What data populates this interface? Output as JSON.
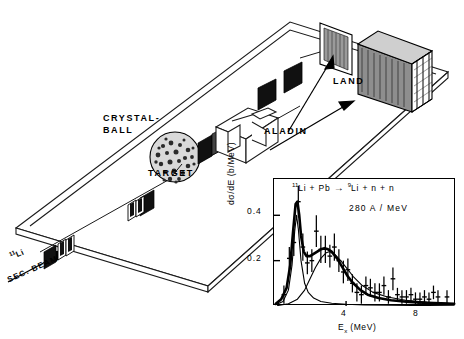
{
  "figure": {
    "type": "experimental-setup-with-inset-spectrum",
    "diagram": {
      "labels": {
        "crystal_ball_line1": "CRYSTAL-",
        "crystal_ball_line2": "BALL",
        "target": "TARGET",
        "aladin": "ALADIN",
        "land": "LAND",
        "beam_ion_sup": "11",
        "beam_ion": "Li",
        "sec_beam": "SEC. BEAM"
      }
    }
  },
  "chart_data": {
    "type": "scatter",
    "title": "",
    "annotations": [
      {
        "name": "reaction",
        "text_parts": [
          "11",
          "Li + Pb ",
          "→",
          " ",
          "9",
          "Li + n + n"
        ]
      },
      {
        "name": "beam-energy",
        "text": "280 A / MeV"
      }
    ],
    "xlabel_parts": [
      "E",
      "x",
      " (MeV)"
    ],
    "ylabel": "dσ/dE  (b/MeV)",
    "xlim": [
      0.0,
      10.1
    ],
    "ylim": [
      0.0,
      0.56
    ],
    "xticks": [
      4,
      8
    ],
    "xticklabels": [
      "4",
      "8"
    ],
    "yticks": [
      0.2,
      0.4
    ],
    "yticklabels": [
      "0.2",
      "0.4"
    ],
    "grid": false,
    "legend": false,
    "x": [
      0.55,
      0.85,
      1.1,
      1.35,
      1.6,
      1.85,
      2.1,
      2.35,
      2.6,
      2.85,
      3.1,
      3.35,
      3.6,
      3.85,
      4.1,
      4.35,
      4.6,
      4.85,
      5.1,
      5.35,
      5.6,
      5.85,
      6.1,
      6.35,
      6.6,
      6.85,
      7.1,
      7.35,
      7.6,
      7.85,
      8.1,
      8.35,
      8.6,
      8.85,
      9.1,
      9.6
    ],
    "y": [
      0.05,
      0.21,
      0.28,
      0.46,
      0.26,
      0.19,
      0.2,
      0.33,
      0.25,
      0.25,
      0.22,
      0.26,
      0.2,
      0.15,
      0.16,
      0.1,
      0.06,
      0.05,
      0.09,
      0.08,
      0.06,
      0.06,
      0.09,
      0.04,
      0.12,
      0.05,
      0.04,
      0.04,
      0.05,
      0.03,
      0.03,
      0.04,
      0.03,
      0.06,
      0.04,
      0.04
    ],
    "yerr": [
      0.04,
      0.05,
      0.06,
      0.07,
      0.06,
      0.05,
      0.05,
      0.07,
      0.06,
      0.06,
      0.05,
      0.06,
      0.05,
      0.05,
      0.05,
      0.04,
      0.04,
      0.04,
      0.04,
      0.04,
      0.04,
      0.04,
      0.04,
      0.03,
      0.05,
      0.03,
      0.03,
      0.03,
      0.03,
      0.03,
      0.03,
      0.03,
      0.03,
      0.03,
      0.03,
      0.03
    ],
    "curves": [
      {
        "name": "total-fit",
        "style": "thick",
        "x": [
          0.1,
          0.4,
          0.7,
          0.9,
          1.05,
          1.2,
          1.3,
          1.4,
          1.5,
          1.65,
          1.8,
          2.0,
          2.2,
          2.4,
          2.6,
          2.8,
          3.0,
          3.2,
          3.5,
          3.8,
          4.1,
          4.4,
          4.8,
          5.2,
          5.8,
          6.5,
          7.5,
          8.5,
          10.0
        ],
        "y": [
          0.01,
          0.03,
          0.08,
          0.18,
          0.32,
          0.45,
          0.46,
          0.4,
          0.31,
          0.24,
          0.22,
          0.22,
          0.23,
          0.24,
          0.25,
          0.255,
          0.25,
          0.24,
          0.21,
          0.17,
          0.13,
          0.1,
          0.07,
          0.05,
          0.035,
          0.025,
          0.018,
          0.014,
          0.01
        ]
      },
      {
        "name": "narrow-resonance",
        "style": "thin",
        "x": [
          0.1,
          0.5,
          0.8,
          1.0,
          1.15,
          1.25,
          1.35,
          1.5,
          1.7,
          1.9,
          2.2,
          2.6,
          3.2,
          4.0,
          5.0,
          6.5,
          8.5,
          10.0
        ],
        "y": [
          0.005,
          0.02,
          0.07,
          0.18,
          0.33,
          0.4,
          0.34,
          0.2,
          0.1,
          0.06,
          0.035,
          0.02,
          0.012,
          0.008,
          0.005,
          0.003,
          0.002,
          0.001
        ]
      },
      {
        "name": "broad-component",
        "style": "thin",
        "x": [
          0.2,
          0.8,
          1.3,
          1.7,
          2.0,
          2.3,
          2.6,
          2.9,
          3.1,
          3.4,
          3.7,
          4.0,
          4.4,
          4.9,
          5.5,
          6.3,
          7.3,
          8.5,
          10.0
        ],
        "y": [
          0.002,
          0.01,
          0.03,
          0.07,
          0.12,
          0.17,
          0.21,
          0.235,
          0.24,
          0.225,
          0.2,
          0.17,
          0.13,
          0.09,
          0.06,
          0.04,
          0.025,
          0.016,
          0.01
        ]
      }
    ]
  }
}
